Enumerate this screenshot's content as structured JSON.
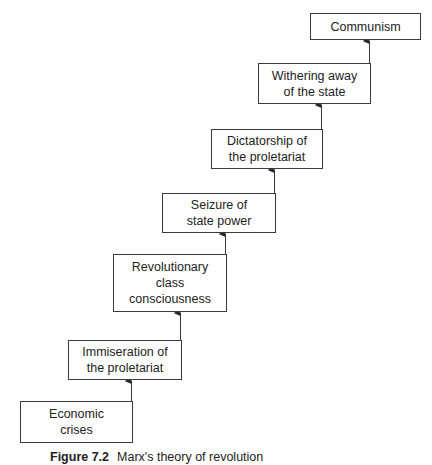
{
  "diagram": {
    "type": "staircase-flow",
    "direction": "bottom-left to top-right",
    "steps": [
      {
        "id": "economic-crises",
        "label": "Economic\ncrises"
      },
      {
        "id": "immiseration",
        "label": "Immiseration of\nthe proletariat"
      },
      {
        "id": "revolutionary-consciousness",
        "label": "Revolutionary\nclass\nconsciousness"
      },
      {
        "id": "seizure-of-power",
        "label": "Seizure of\nstate power"
      },
      {
        "id": "dictatorship",
        "label": "Dictatorship of\nthe proletariat"
      },
      {
        "id": "withering-away",
        "label": "Withering away\nof the state"
      },
      {
        "id": "communism",
        "label": "Communism"
      }
    ],
    "edges": [
      {
        "from": "economic-crises",
        "to": "immiseration"
      },
      {
        "from": "immiseration",
        "to": "revolutionary-consciousness"
      },
      {
        "from": "revolutionary-consciousness",
        "to": "seizure-of-power"
      },
      {
        "from": "seizure-of-power",
        "to": "dictatorship"
      },
      {
        "from": "dictatorship",
        "to": "withering-away"
      },
      {
        "from": "withering-away",
        "to": "communism"
      }
    ]
  },
  "caption": {
    "figure": "Figure 7.2",
    "text": "Marx's theory of revolution"
  },
  "colors": {
    "line": "#3a3a3a",
    "text": "#222222",
    "background": "#ffffff"
  }
}
